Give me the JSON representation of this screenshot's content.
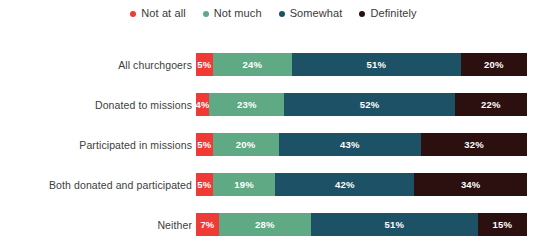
{
  "legend": {
    "position": "top-center",
    "items": [
      {
        "label": "Not at all",
        "color": "#f03a35",
        "icon": "legend-dot-icon"
      },
      {
        "label": "Not much",
        "color": "#5faa85",
        "icon": "legend-dot-icon"
      },
      {
        "label": "Somewhat",
        "color": "#1d5266",
        "icon": "legend-dot-icon"
      },
      {
        "label": "Definitely",
        "color": "#2c0f0f",
        "icon": "legend-dot-icon"
      }
    ]
  },
  "chart_data": {
    "type": "bar",
    "orientation": "horizontal",
    "stacked": true,
    "normalized": "percent",
    "title": "",
    "subtitle": "",
    "xlabel": "",
    "ylabel": "",
    "xlim": [
      0,
      100
    ],
    "grid": false,
    "legend_position": "top-center",
    "categories": [
      "All churchgoers",
      "Donated to missions",
      "Participated in missions",
      "Both donated and participated",
      "Neither"
    ],
    "series": [
      {
        "name": "Not at all",
        "color": "#f03a35",
        "values": [
          5,
          4,
          5,
          5,
          7
        ]
      },
      {
        "name": "Not much",
        "color": "#5faa85",
        "values": [
          24,
          23,
          20,
          19,
          28
        ]
      },
      {
        "name": "Somewhat",
        "color": "#1d5266",
        "values": [
          51,
          52,
          43,
          42,
          51
        ]
      },
      {
        "name": "Definitely",
        "color": "#2c0f0f",
        "values": [
          20,
          22,
          32,
          34,
          15
        ]
      }
    ],
    "value_labels": [
      [
        "5%",
        "24%",
        "51%",
        "20%"
      ],
      [
        "4%",
        "23%",
        "52%",
        "22%"
      ],
      [
        "5%",
        "20%",
        "43%",
        "32%"
      ],
      [
        "5%",
        "19%",
        "42%",
        "34%"
      ],
      [
        "7%",
        "28%",
        "51%",
        "15%"
      ]
    ]
  }
}
